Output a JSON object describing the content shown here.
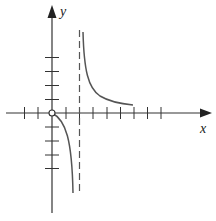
{
  "graph": {
    "x_axis_label": "x",
    "y_axis_label": "y",
    "colors": {
      "axes": "#333333",
      "curve": "#555555",
      "asymptote": "#555555",
      "background": "#ffffff"
    },
    "x_ticks": [
      -2,
      -1,
      1,
      2,
      3,
      4,
      5,
      6,
      7,
      8
    ],
    "y_ticks": [
      -4,
      -3,
      -2,
      -1,
      1,
      2,
      3,
      4
    ],
    "vertical_asymptote": {
      "x": 2,
      "style": "dashed"
    },
    "open_point": {
      "x": 0,
      "y": 0
    },
    "branches": [
      {
        "name": "right-branch",
        "domain": "x > 2",
        "from": [
          2.3,
          6
        ],
        "to": [
          6,
          0.6
        ],
        "behavior": "decreasing toward x-axis"
      },
      {
        "name": "left-branch",
        "domain": "x < 2",
        "from": [
          0,
          0
        ],
        "to": [
          1.55,
          -6
        ],
        "behavior": "decreasing to -infinity near asymptote"
      }
    ]
  }
}
